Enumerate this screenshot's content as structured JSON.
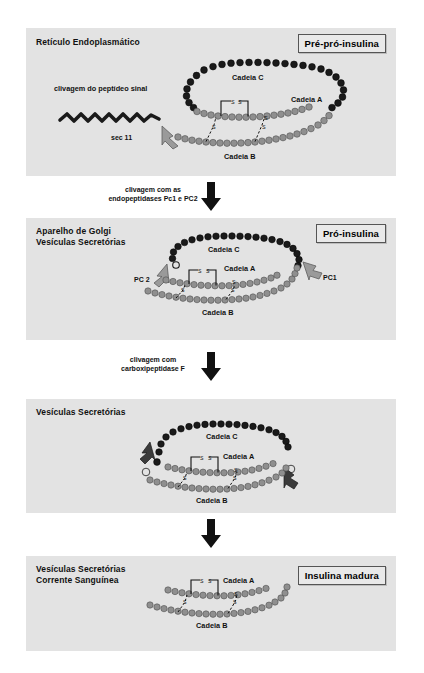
{
  "figure": {
    "language": "pt-BR",
    "background_color": "#e3e3e3",
    "chain_c_color": "#1a1a1a",
    "chain_ab_color": "#8a8a8a"
  },
  "panels": [
    {
      "id": "panel-1",
      "location_label": "Retículo Endoplasmático",
      "stage_label": "Pré-pró-insulina",
      "annotations": {
        "cleavage_note": "clivagem do peptídeo sinal",
        "enzyme": "sec 11"
      },
      "chains": [
        {
          "name": "Cadeia C",
          "color": "#1a1a1a"
        },
        {
          "name": "Cadeia A",
          "color": "#8a8a8a"
        },
        {
          "name": "Cadeia B",
          "color": "#8a8a8a"
        }
      ],
      "bonds": [
        "S",
        "S",
        "S",
        "S",
        "S",
        "S"
      ]
    },
    {
      "id": "panel-2",
      "location_label": "Aparelho de Golgi\nVesículas Secretórias",
      "stage_label": "Pró-insulina",
      "annotations": {
        "protease_left": "PC 2",
        "protease_right": "PC1"
      },
      "chains": [
        {
          "name": "Cadeia C",
          "color": "#1a1a1a"
        },
        {
          "name": "Cadeia A",
          "color": "#8a8a8a"
        },
        {
          "name": "Cadeia B",
          "color": "#8a8a8a"
        }
      ],
      "bonds": [
        "S",
        "S",
        "S",
        "S",
        "S",
        "S"
      ]
    },
    {
      "id": "panel-3",
      "location_label": "Vesículas Secretórias",
      "stage_label": "",
      "annotations": {},
      "chains": [
        {
          "name": "Cadeia C",
          "color": "#1a1a1a"
        },
        {
          "name": "Cadeia A",
          "color": "#8a8a8a"
        },
        {
          "name": "Cadeia B",
          "color": "#8a8a8a"
        }
      ],
      "bonds": [
        "S",
        "S",
        "S",
        "S",
        "S",
        "S"
      ]
    },
    {
      "id": "panel-4",
      "location_label": "Vesículas Secretórias\nCorrente Sanguínea",
      "stage_label": "Insulina madura",
      "annotations": {},
      "chains": [
        {
          "name": "Cadeia A",
          "color": "#8a8a8a"
        },
        {
          "name": "Cadeia B",
          "color": "#8a8a8a"
        }
      ],
      "bonds": [
        "S",
        "S",
        "S",
        "S",
        "S",
        "S"
      ]
    }
  ],
  "transitions": [
    {
      "id": "transition-1",
      "label": "clivagem com as\nendopeptidases Pc1 e PC2",
      "icon": "down-arrow-icon"
    },
    {
      "id": "transition-2",
      "label": "clivagem com\ncarboxipeptidase F",
      "icon": "down-arrow-icon"
    },
    {
      "id": "transition-3",
      "label": "",
      "icon": "down-arrow-icon"
    }
  ]
}
